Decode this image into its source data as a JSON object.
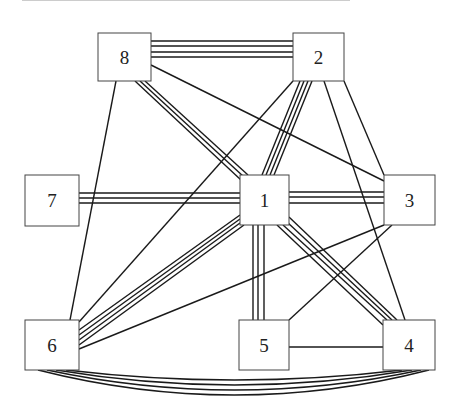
{
  "diagram": {
    "type": "graph",
    "colors": {
      "edge": "#1a1a1a",
      "node_border": "#444444",
      "background": "#ffffff"
    },
    "nodes": [
      {
        "id": "1",
        "label": "1",
        "x": 240,
        "y": 175,
        "w": 49,
        "h": 50
      },
      {
        "id": "2",
        "label": "2",
        "x": 293,
        "y": 33,
        "w": 51,
        "h": 48
      },
      {
        "id": "3",
        "label": "3",
        "x": 384,
        "y": 175,
        "w": 51,
        "h": 50
      },
      {
        "id": "4",
        "label": "4",
        "x": 383,
        "y": 320,
        "w": 52,
        "h": 50
      },
      {
        "id": "5",
        "label": "5",
        "x": 239,
        "y": 320,
        "w": 50,
        "h": 50
      },
      {
        "id": "6",
        "label": "6",
        "x": 25,
        "y": 320,
        "w": 54,
        "h": 50
      },
      {
        "id": "7",
        "label": "7",
        "x": 25,
        "y": 175,
        "w": 54,
        "h": 51
      },
      {
        "id": "8",
        "label": "8",
        "x": 98,
        "y": 33,
        "w": 53,
        "h": 48
      }
    ],
    "edges": [
      {
        "from": "8",
        "to": "2",
        "multiplicity": 4
      },
      {
        "from": "8",
        "to": "1",
        "multiplicity": 3
      },
      {
        "from": "8",
        "to": "3",
        "multiplicity": 1
      },
      {
        "from": "8",
        "to": "6",
        "multiplicity": 1
      },
      {
        "from": "2",
        "to": "1",
        "multiplicity": 4
      },
      {
        "from": "2",
        "to": "6",
        "multiplicity": 1
      },
      {
        "from": "2",
        "to": "3",
        "multiplicity": 1
      },
      {
        "from": "2",
        "to": "4",
        "multiplicity": 1
      },
      {
        "from": "7",
        "to": "1",
        "multiplicity": 3
      },
      {
        "from": "1",
        "to": "3",
        "multiplicity": 3
      },
      {
        "from": "1",
        "to": "6",
        "multiplicity": 4
      },
      {
        "from": "1",
        "to": "5",
        "multiplicity": 3
      },
      {
        "from": "1",
        "to": "4",
        "multiplicity": 4
      },
      {
        "from": "3",
        "to": "6",
        "multiplicity": 1
      },
      {
        "from": "3",
        "to": "5",
        "multiplicity": 1
      },
      {
        "from": "5",
        "to": "4",
        "multiplicity": 1
      },
      {
        "from": "6",
        "to": "4",
        "multiplicity": 4,
        "curved": true
      }
    ]
  }
}
